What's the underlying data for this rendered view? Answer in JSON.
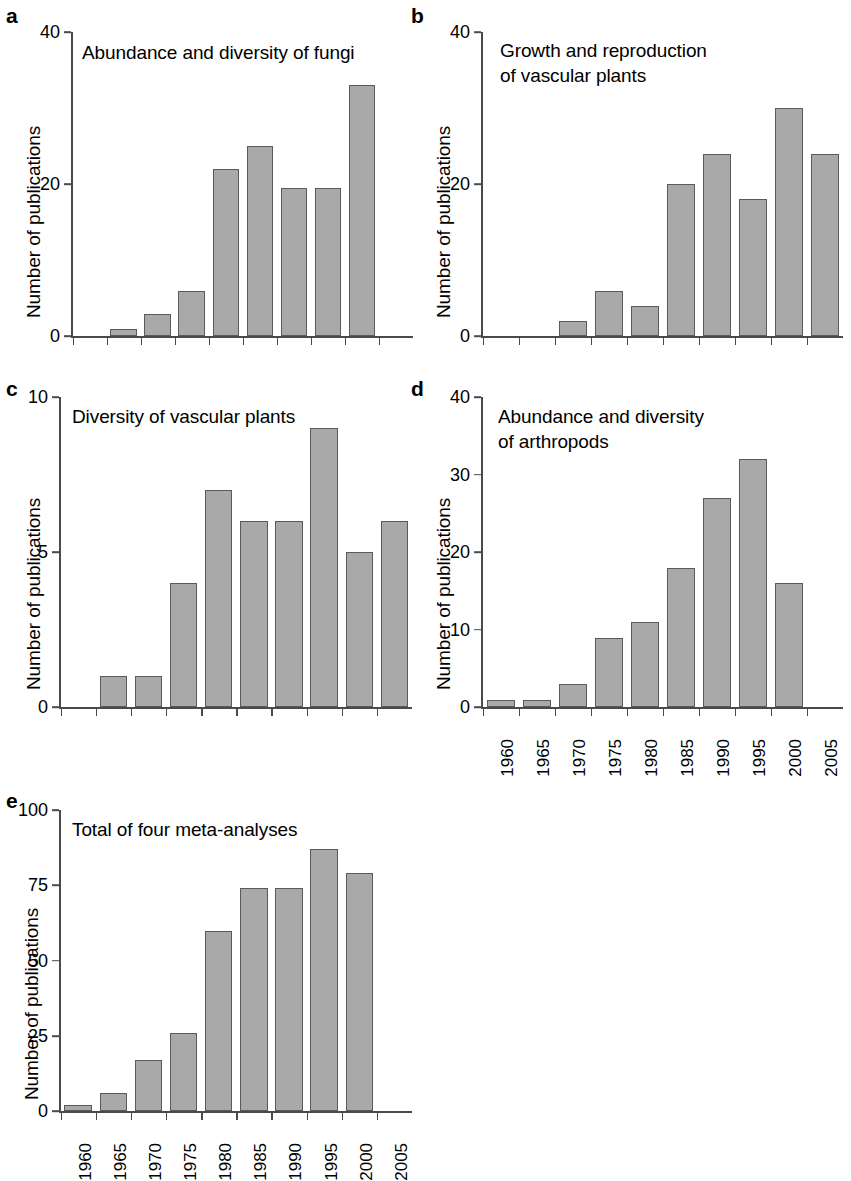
{
  "figure": {
    "y_axis_label": "Number of publications",
    "bar_color": "#a9a9a9",
    "bar_edge_color": "#5a5a5a",
    "axis_color": "#4a4a4a"
  },
  "panels": [
    {
      "letter": "a",
      "title": "Abundance and diversity of fungi",
      "chart_data": {
        "type": "bar",
        "title": "Abundance and diversity of fungi",
        "xlabel": "",
        "ylabel": "Number of publications",
        "categories": [
          "1960",
          "1965",
          "1970",
          "1975",
          "1980",
          "1985",
          "1990",
          "1995",
          "2000",
          "2005"
        ],
        "values": [
          0,
          1,
          3,
          6,
          22,
          25,
          19.5,
          19.5,
          33,
          0
        ],
        "ylim": [
          0,
          40
        ],
        "yticks": [
          0,
          20,
          40
        ],
        "ytick_labels": [
          "0",
          "20",
          "40"
        ],
        "xtick_labels_visible": false,
        "grid": false,
        "legend": "none"
      }
    },
    {
      "letter": "b",
      "title": "Growth and reproduction\nof vascular plants",
      "chart_data": {
        "type": "bar",
        "title": "Growth and reproduction of vascular plants",
        "xlabel": "",
        "ylabel": "Number of publications",
        "categories": [
          "1960",
          "1965",
          "1970",
          "1975",
          "1980",
          "1985",
          "1990",
          "1995",
          "2000",
          "2005"
        ],
        "values": [
          0,
          0,
          2,
          6,
          4,
          20,
          24,
          18,
          30,
          24
        ],
        "ylim": [
          0,
          40
        ],
        "yticks": [
          0,
          20,
          40
        ],
        "ytick_labels": [
          "0",
          "20",
          "40"
        ],
        "xtick_labels_visible": false,
        "grid": false,
        "legend": "none"
      }
    },
    {
      "letter": "c",
      "title": "Diversity of vascular plants",
      "chart_data": {
        "type": "bar",
        "title": "Diversity of vascular plants",
        "xlabel": "",
        "ylabel": "Number of publications",
        "categories": [
          "1960",
          "1965",
          "1970",
          "1975",
          "1980",
          "1985",
          "1990",
          "1995",
          "2000",
          "2005"
        ],
        "values": [
          0,
          1,
          1,
          4,
          7,
          6,
          6,
          9,
          5,
          6
        ],
        "ylim": [
          0,
          10
        ],
        "yticks": [
          0,
          5,
          10
        ],
        "ytick_labels": [
          "0",
          "5",
          "10"
        ],
        "xtick_labels_visible": false,
        "grid": false,
        "legend": "none"
      }
    },
    {
      "letter": "d",
      "title": "Abundance and diversity\nof arthropods",
      "chart_data": {
        "type": "bar",
        "title": "Abundance and diversity of arthropods",
        "xlabel": "",
        "ylabel": "Number of publications",
        "categories": [
          "1960",
          "1965",
          "1970",
          "1975",
          "1980",
          "1985",
          "1990",
          "1995",
          "2000",
          "2005"
        ],
        "values": [
          1,
          1,
          3,
          9,
          11,
          18,
          27,
          32,
          16,
          0
        ],
        "ylim": [
          0,
          40
        ],
        "yticks": [
          0,
          10,
          20,
          30,
          40
        ],
        "ytick_labels": [
          "0",
          "10",
          "20",
          "30",
          "40"
        ],
        "xtick_labels_visible": true,
        "grid": false,
        "legend": "none"
      }
    },
    {
      "letter": "e",
      "title": "Total of four meta-analyses",
      "chart_data": {
        "type": "bar",
        "title": "Total of four meta-analyses",
        "xlabel": "",
        "ylabel": "Number of publications",
        "categories": [
          "1960",
          "1965",
          "1970",
          "1975",
          "1980",
          "1985",
          "1990",
          "1995",
          "2000",
          "2005"
        ],
        "values": [
          2,
          6,
          17,
          26,
          60,
          74,
          74,
          87,
          79,
          0
        ],
        "ylim": [
          0,
          100
        ],
        "yticks": [
          0,
          25,
          50,
          75,
          100
        ],
        "ytick_labels": [
          "0",
          "25",
          "50",
          "75",
          "100"
        ],
        "xtick_labels_visible": true,
        "grid": false,
        "legend": "none"
      }
    }
  ]
}
